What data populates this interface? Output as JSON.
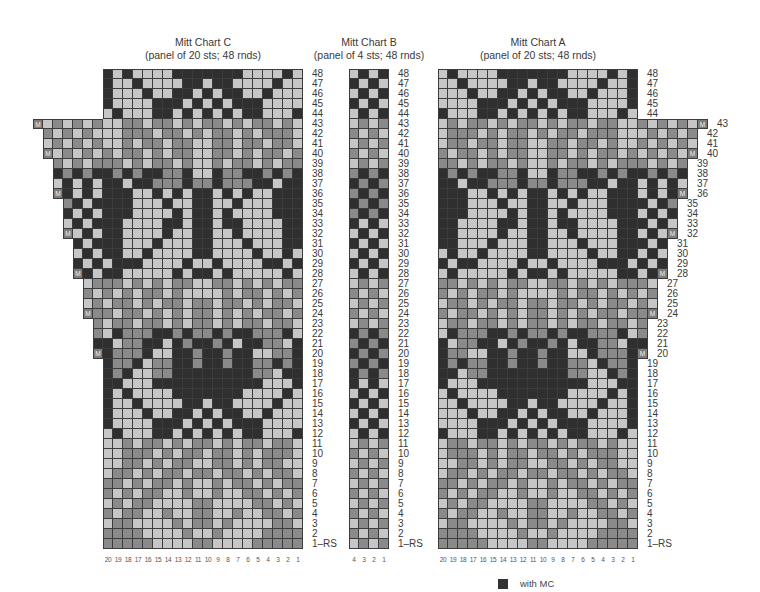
{
  "legend": {
    "swatch_label": "with MC",
    "swatch_color": "#333333"
  },
  "colors": {
    "dark_MC": "#2f2f2f",
    "mid_gray": "#8a8a8a",
    "light": "#c6c6c6",
    "marker": "#7d7d7d"
  },
  "codes": {
    "D": "dark (MC)",
    "G": "medium gray",
    "L": "light",
    "M": "make one (increase)"
  },
  "charts": [
    {
      "id": "C",
      "title": "Mitt Chart C",
      "subtitle": "(panel of 20 sts; 48 rnds)",
      "panel_sts": 20,
      "rounds": 48,
      "left": 103,
      "top": 69,
      "extra_side": "left",
      "col_labels": [
        "20",
        "19",
        "18",
        "17",
        "16",
        "15",
        "14",
        "13",
        "12",
        "11",
        "10",
        "9",
        "8",
        "7",
        "6",
        "5",
        "4",
        "3",
        "2",
        "1"
      ],
      "rows": [
        {
          "n": "48",
          "extra": "",
          "cells": "DLDLLLLDDDDDDDLLLLDL"
        },
        {
          "n": "47",
          "extra": "",
          "cells": "DLLDLLLLDDLDDLLLLDLL"
        },
        {
          "n": "46",
          "extra": "",
          "cells": "DLLLDLLDDLDLDDLLDLLL"
        },
        {
          "n": "45",
          "extra": "",
          "cells": "DLLLLDDDLDLDLDDDLLLL"
        },
        {
          "n": "44",
          "extra": "",
          "cells": "LDLLLDDLDLDLDLDDLLLD"
        },
        {
          "n": "43",
          "extra": "MLGLGLG",
          "cells": "LLGGLGGLGLGGLGLGGLGL"
        },
        {
          "n": "42",
          "extra": "GLGLGL",
          "cells": "LLGGGLGGLGLGGLGLGGGL"
        },
        {
          "n": "41",
          "extra": "LGLGLG",
          "cells": "LLGLGGLGGLLGGLGGLGGL"
        },
        {
          "n": "40",
          "extra": "MLGLGL",
          "cells": "GLGGLGLGGLLGGLGLGGLG"
        },
        {
          "n": "39",
          "extra": "GLGLG",
          "cells": "GGLGLGGLGLLGLGGLGLGG"
        },
        {
          "n": "38",
          "extra": "DGDGD",
          "cells": "DGDGDDGGDLLDGGDDGDGD"
        },
        {
          "n": "37",
          "extra": "LDLDL",
          "cells": "DDLDDGGGDGGDGGGDDLDD"
        },
        {
          "n": "36",
          "extra": "MDLDL",
          "cells": "DDDLLDLDLDDLDLDLLDDD"
        },
        {
          "n": "35",
          "extra": "GDLD",
          "cells": "DDDLLLDLLDDLLDLLLDDD"
        },
        {
          "n": "34",
          "extra": "DLDL",
          "cells": "DDDLLLLDLDDLDLLLLDDD"
        },
        {
          "n": "33",
          "extra": "LDLD",
          "cells": "DDLLLLDDLDDLDDLLLLDD"
        },
        {
          "n": "32",
          "extra": "MLDL",
          "cells": "DDLLLLDLLDDLLDLLLLDD"
        },
        {
          "n": "31",
          "extra": "DLD",
          "cells": "DDLLLDLLLDDLLLDLLLDD"
        },
        {
          "n": "30",
          "extra": "LDL",
          "cells": "DDLLDLLLLDDLLLLDLLDL"
        },
        {
          "n": "29",
          "extra": "DLD",
          "cells": "LDDDLLLLDLLDLLLLDDLD"
        },
        {
          "n": "28",
          "extra": "MDL",
          "cells": "DDLLLLLDLDDLDLLLLLDL"
        },
        {
          "n": "27",
          "extra": "LG",
          "cells": "GGLGLGLGGLLGGLGLGLGG"
        },
        {
          "n": "26",
          "extra": "GL",
          "cells": "GLGLGGLGLLLLGLGGLGLG"
        },
        {
          "n": "25",
          "extra": "LG",
          "cells": "LGGLGLGGLGGLGGLGLGGL"
        },
        {
          "n": "24",
          "extra": "MG",
          "cells": "GLGGLGLGLGGLGLGLGGLG"
        },
        {
          "n": "23",
          "extra": "G",
          "cells": "LGGLGGLGLGGLGLGGLGGL"
        },
        {
          "n": "22",
          "extra": "G",
          "cells": "LDGGGDDGDGGDGDDGGGDL"
        },
        {
          "n": "21",
          "extra": "D",
          "cells": "DLGGDDLDGDDGDLDDGGLD"
        },
        {
          "n": "20",
          "extra": "M",
          "cells": "DGGGDLLDDGDDGDDLLGGD"
        },
        {
          "n": "19",
          "extra": "",
          "cells": "DGGDLGGDDGDDGDDGGDGD"
        },
        {
          "n": "18",
          "extra": "",
          "cells": "DGDLLGGDDDDDDDDGGLDD"
        },
        {
          "n": "17",
          "extra": "",
          "cells": "DDLLLDDDDDDDDDDDLLLD"
        },
        {
          "n": "16",
          "extra": "",
          "cells": "DLDLLLLDDDDDDDLLLLDL"
        },
        {
          "n": "15",
          "extra": "",
          "cells": "DLLDLLLLDDLDDLLLLDLL"
        },
        {
          "n": "14",
          "extra": "",
          "cells": "DLLLDLLDDLDLDDLLDLLL"
        },
        {
          "n": "13",
          "extra": "",
          "cells": "DLLLLDDDLDLDLDDDLLLL"
        },
        {
          "n": "12",
          "extra": "",
          "cells": "LDLLLDDLDLDLDLDDLLLD"
        },
        {
          "n": "11",
          "extra": "",
          "cells": "LLGLGGLGLGGLGLGGLGGL"
        },
        {
          "n": "10",
          "extra": "",
          "cells": "LLGGGLGLGGLGGLGLGGGL"
        },
        {
          "n": "9",
          "extra": "",
          "cells": "LLGGLGLGGLLGGLGLGGLL"
        },
        {
          "n": "8",
          "extra": "",
          "cells": "LGGLGLGGLGGLGGLGLGGL"
        },
        {
          "n": "7",
          "extra": "",
          "cells": "GGLGLGGLGLLGLGGLGLGG"
        },
        {
          "n": "6",
          "extra": "",
          "cells": "GLGLGGLLGLLGLLGGLGLG"
        },
        {
          "n": "5",
          "extra": "",
          "cells": "LGLGGLLLLGGLLLLGGLGL"
        },
        {
          "n": "4",
          "extra": "",
          "cells": "GLGGLLGLLGGLLGLLGGLG"
        },
        {
          "n": "3",
          "extra": "",
          "cells": "LGGLLLLGLGGLGLLLLGGL"
        },
        {
          "n": "2",
          "extra": "",
          "cells": "GGGGLLLLGLLGLLLLGGGG"
        },
        {
          "n": "1-RS",
          "extra": "",
          "cells": "GGGGGLLLLGGLLLLGGGGG"
        }
      ]
    },
    {
      "id": "B",
      "title": "Mitt Chart B",
      "subtitle": "(panel of 4 sts; 48 rnds)",
      "panel_sts": 4,
      "rounds": 48,
      "left": 349,
      "top": 69,
      "extra_side": "none",
      "col_labels": [
        "4",
        "3",
        "2",
        "1"
      ],
      "rows": [
        {
          "n": "48",
          "extra": "",
          "cells": "LDLD"
        },
        {
          "n": "47",
          "extra": "",
          "cells": "DLDL"
        },
        {
          "n": "46",
          "extra": "",
          "cells": "LDLD"
        },
        {
          "n": "45",
          "extra": "",
          "cells": "DLDL"
        },
        {
          "n": "44",
          "extra": "",
          "cells": "LDLD"
        },
        {
          "n": "43",
          "extra": "",
          "cells": "LGLG"
        },
        {
          "n": "42",
          "extra": "",
          "cells": "GLGL"
        },
        {
          "n": "41",
          "extra": "",
          "cells": "LGLG"
        },
        {
          "n": "40",
          "extra": "",
          "cells": "GLGL"
        },
        {
          "n": "39",
          "extra": "",
          "cells": "LGLG"
        },
        {
          "n": "38",
          "extra": "",
          "cells": "GDGD"
        },
        {
          "n": "37",
          "extra": "",
          "cells": "DGDG"
        },
        {
          "n": "36",
          "extra": "",
          "cells": "GDGD"
        },
        {
          "n": "35",
          "extra": "",
          "cells": "DGDG"
        },
        {
          "n": "34",
          "extra": "",
          "cells": "GDGD"
        },
        {
          "n": "33",
          "extra": "",
          "cells": "DLDL"
        },
        {
          "n": "32",
          "extra": "",
          "cells": "LDLD"
        },
        {
          "n": "31",
          "extra": "",
          "cells": "DLDL"
        },
        {
          "n": "30",
          "extra": "",
          "cells": "LDLD"
        },
        {
          "n": "29",
          "extra": "",
          "cells": "DLDL"
        },
        {
          "n": "28",
          "extra": "",
          "cells": "LDLD"
        },
        {
          "n": "27",
          "extra": "",
          "cells": "LGLG"
        },
        {
          "n": "26",
          "extra": "",
          "cells": "GLGL"
        },
        {
          "n": "25",
          "extra": "",
          "cells": "LGLG"
        },
        {
          "n": "24",
          "extra": "",
          "cells": "GLGL"
        },
        {
          "n": "23",
          "extra": "",
          "cells": "LGLG"
        },
        {
          "n": "22",
          "extra": "",
          "cells": "DGDG"
        },
        {
          "n": "21",
          "extra": "",
          "cells": "GDGD"
        },
        {
          "n": "20",
          "extra": "",
          "cells": "DGDG"
        },
        {
          "n": "19",
          "extra": "",
          "cells": "GDGD"
        },
        {
          "n": "18",
          "extra": "",
          "cells": "DGDG"
        },
        {
          "n": "17",
          "extra": "",
          "cells": "DLDL"
        },
        {
          "n": "16",
          "extra": "",
          "cells": "LDLD"
        },
        {
          "n": "15",
          "extra": "",
          "cells": "DLDL"
        },
        {
          "n": "14",
          "extra": "",
          "cells": "LDLD"
        },
        {
          "n": "13",
          "extra": "",
          "cells": "DLDL"
        },
        {
          "n": "12",
          "extra": "",
          "cells": "LDLD"
        },
        {
          "n": "11",
          "extra": "",
          "cells": "LGLG"
        },
        {
          "n": "10",
          "extra": "",
          "cells": "GLGL"
        },
        {
          "n": "9",
          "extra": "",
          "cells": "LGLG"
        },
        {
          "n": "8",
          "extra": "",
          "cells": "GLGL"
        },
        {
          "n": "7",
          "extra": "",
          "cells": "LGLG"
        },
        {
          "n": "6",
          "extra": "",
          "cells": "GLGL"
        },
        {
          "n": "5",
          "extra": "",
          "cells": "LGLG"
        },
        {
          "n": "4",
          "extra": "",
          "cells": "GLGL"
        },
        {
          "n": "3",
          "extra": "",
          "cells": "LGLG"
        },
        {
          "n": "2",
          "extra": "",
          "cells": "GLGL"
        },
        {
          "n": "1-RS",
          "extra": "",
          "cells": "LGLG"
        }
      ]
    },
    {
      "id": "A",
      "title": "Mitt Chart A",
      "subtitle": "(panel of 20 sts; 48 rnds)",
      "panel_sts": 20,
      "rounds": 48,
      "left": 438,
      "top": 69,
      "extra_side": "right",
      "col_labels": [
        "20",
        "19",
        "18",
        "17",
        "16",
        "15",
        "14",
        "13",
        "12",
        "11",
        "10",
        "9",
        "8",
        "7",
        "6",
        "5",
        "4",
        "3",
        "2",
        "1"
      ],
      "mirror_of": "C"
    }
  ]
}
